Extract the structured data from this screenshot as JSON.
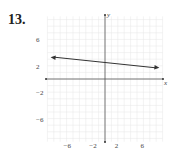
{
  "problem_number": "13.",
  "chart_data": {
    "type": "line",
    "title": "",
    "xlabel": "x",
    "ylabel": "y",
    "xlim": [
      -9,
      9
    ],
    "ylim": [
      -9,
      9
    ],
    "grid": true,
    "x_tick_labels": [
      "−6",
      "−2",
      "2",
      "6"
    ],
    "y_tick_labels": [
      "6",
      "2",
      "−2",
      "−6"
    ],
    "series": [
      {
        "name": "line",
        "x": [
          -8.5,
          8.5
        ],
        "y": [
          3.3,
          1.7
        ],
        "arrows": "both"
      }
    ],
    "approx_equation": "y = -0.09x + 2.5"
  }
}
